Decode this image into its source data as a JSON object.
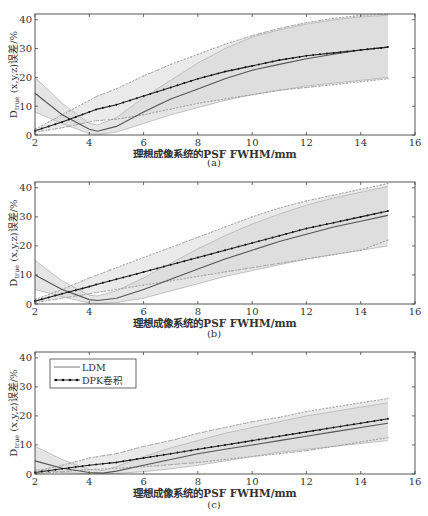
{
  "figure": {
    "captions": [
      "(a)",
      "(b)",
      "(c)"
    ],
    "xlabel": "理想成像系统的PSF FWHM/mm",
    "ylabel_main": "D",
    "ylabel_sub": "true",
    "ylabel_rest": " (x,y,z)误差/%",
    "legend": {
      "ldm": "LDM",
      "dpk": "DPK卷积"
    }
  },
  "chart_data": [
    {
      "type": "line",
      "panel": "(a)",
      "xlabel": "理想成像系统的PSF FWHM/mm",
      "ylabel": "D_true (x,y,z)误差/%",
      "xlim": [
        2,
        16
      ],
      "ylim": [
        0,
        42
      ],
      "xticks": [
        2,
        4,
        6,
        8,
        10,
        12,
        14,
        16
      ],
      "yticks": [
        0,
        10,
        20,
        30,
        40
      ],
      "x": [
        2,
        3,
        4,
        4.3,
        5,
        6,
        7,
        8,
        9,
        10,
        11,
        12,
        13,
        14,
        15
      ],
      "series": [
        {
          "name": "LDM",
          "values": [
            14.5,
            7,
            2,
            1.3,
            3,
            8,
            12.5,
            16,
            19.5,
            22.5,
            24.5,
            26.5,
            28,
            29.5,
            30.5
          ]
        },
        {
          "name": "LDM upper",
          "values": [
            20,
            11,
            4,
            3.5,
            6,
            13,
            19,
            25,
            30,
            34,
            36.5,
            38.5,
            40,
            41,
            41.5
          ]
        },
        {
          "name": "LDM lower",
          "values": [
            8,
            4,
            0.5,
            0.2,
            1,
            4,
            7,
            9.5,
            12,
            14,
            15.5,
            17,
            18,
            19,
            20
          ]
        },
        {
          "name": "DPK卷积",
          "values": [
            1.5,
            4.5,
            8,
            9,
            10.5,
            13.5,
            16.5,
            19.5,
            22,
            24,
            26,
            27.5,
            28.5,
            29.5,
            30.5
          ]
        },
        {
          "name": "DPK upper",
          "values": [
            2,
            7,
            12,
            13.5,
            16,
            20.5,
            24.5,
            28,
            31.5,
            34.5,
            37,
            39,
            40.5,
            41.5,
            42
          ]
        },
        {
          "name": "DPK lower",
          "values": [
            1,
            2.5,
            4.5,
            5,
            5.5,
            7,
            9,
            11,
            12.5,
            14,
            15.5,
            16.5,
            17.5,
            18.5,
            19.5
          ]
        }
      ],
      "legend": [
        "LDM",
        "DPK卷积"
      ]
    },
    {
      "type": "line",
      "panel": "(b)",
      "xlabel": "理想成像系统的PSF FWHM/mm",
      "ylabel": "D_true (x,y,z)误差/%",
      "xlim": [
        2,
        16
      ],
      "ylim": [
        0,
        42
      ],
      "xticks": [
        2,
        4,
        6,
        8,
        10,
        12,
        14,
        16
      ],
      "yticks": [
        0,
        10,
        20,
        30,
        40
      ],
      "x": [
        2,
        3,
        4,
        4.3,
        5,
        6,
        7,
        8,
        9,
        10,
        11,
        12,
        13,
        14,
        15
      ],
      "series": [
        {
          "name": "LDM",
          "values": [
            10,
            5,
            1.5,
            1.2,
            2,
            5,
            8.5,
            12,
            15.5,
            18.5,
            21.5,
            24,
            26.5,
            28.5,
            30.5
          ]
        },
        {
          "name": "LDM upper",
          "values": [
            15,
            8,
            3,
            2.8,
            4.5,
            9,
            14,
            19,
            23.5,
            27.5,
            31,
            34,
            36.5,
            38.5,
            40.5
          ]
        },
        {
          "name": "LDM lower",
          "values": [
            5,
            2.5,
            0.3,
            0.2,
            0.5,
            2,
            4.5,
            7,
            9.5,
            11.5,
            13.5,
            15.5,
            17,
            18.5,
            20
          ]
        },
        {
          "name": "DPK卷积",
          "values": [
            1,
            3.5,
            6,
            6.8,
            8.5,
            11,
            13.5,
            16,
            18.5,
            21,
            23.5,
            26,
            28,
            30,
            32
          ]
        },
        {
          "name": "DPK upper",
          "values": [
            1.5,
            5,
            9,
            10,
            12.5,
            16,
            19.5,
            23,
            26.5,
            30,
            33,
            35.5,
            37.5,
            39.5,
            41.5
          ]
        },
        {
          "name": "DPK lower",
          "values": [
            0.5,
            2,
            3.5,
            4,
            5,
            6.5,
            8,
            9.5,
            11,
            12.5,
            14,
            15.5,
            17,
            18.5,
            22
          ]
        }
      ],
      "legend": [
        "LDM",
        "DPK卷积"
      ]
    },
    {
      "type": "line",
      "panel": "(c)",
      "xlabel": "理想成像系统的PSF FWHM/mm",
      "ylabel": "D_true (x,y,z)误差/%",
      "xlim": [
        2,
        16
      ],
      "ylim": [
        0,
        42
      ],
      "xticks": [
        2,
        4,
        6,
        8,
        10,
        12,
        14,
        16
      ],
      "yticks": [
        0,
        10,
        20,
        30,
        40
      ],
      "x": [
        2,
        3,
        4,
        4.5,
        5,
        6,
        7,
        8,
        9,
        10,
        11,
        12,
        13,
        14,
        15
      ],
      "series": [
        {
          "name": "LDM",
          "values": [
            4.5,
            2,
            0.5,
            0.3,
            1,
            3,
            5,
            7,
            8.5,
            10,
            11.5,
            13,
            14.5,
            16,
            17.5
          ]
        },
        {
          "name": "LDM upper",
          "values": [
            9.5,
            5,
            1.5,
            1.2,
            2.5,
            6,
            9,
            11.5,
            14,
            16,
            18,
            20,
            21.5,
            23,
            24.5
          ]
        },
        {
          "name": "LDM lower",
          "values": [
            1.5,
            0.5,
            0.1,
            0.1,
            0.2,
            0.8,
            1.8,
            3,
            4.5,
            6,
            7.5,
            8.5,
            9.5,
            10.5,
            11.5
          ]
        },
        {
          "name": "DPK卷积",
          "values": [
            0.5,
            1.8,
            3,
            3.5,
            4,
            5.5,
            7,
            8.5,
            10,
            11.5,
            13,
            14.5,
            16,
            17.5,
            19
          ]
        },
        {
          "name": "DPK upper",
          "values": [
            1,
            3,
            5.5,
            6.3,
            7,
            9.5,
            11.5,
            14,
            16,
            18,
            19.5,
            21.5,
            23,
            24.5,
            26
          ]
        },
        {
          "name": "DPK lower",
          "values": [
            0.2,
            0.8,
            1.5,
            1.7,
            2,
            2.5,
            3.2,
            4,
            5,
            6,
            7,
            8,
            9.5,
            11,
            12.5
          ]
        }
      ],
      "legend": [
        "LDM",
        "DPK卷积"
      ]
    }
  ]
}
